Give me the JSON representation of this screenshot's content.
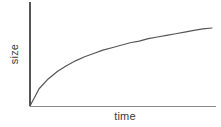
{
  "chart_data": {
    "type": "line",
    "title": "",
    "subtitle": "",
    "xlabel": "time",
    "ylabel": "size",
    "grid": false,
    "legend": null,
    "tick_labels": {
      "x": [],
      "y": []
    },
    "axis_style": {
      "spines": [
        "left",
        "bottom"
      ],
      "arrowheads": false,
      "ticks": false
    },
    "xlim": [
      0,
      1
    ],
    "ylim": [
      0,
      1
    ],
    "annotations": [],
    "series": [
      {
        "name": "growth",
        "color": "#555555",
        "width": 1.2,
        "x": [
          0.0,
          0.05,
          0.1,
          0.15,
          0.2,
          0.25,
          0.3,
          0.35,
          0.4,
          0.45,
          0.5,
          0.55,
          0.6,
          0.65,
          0.7,
          0.75,
          0.8,
          0.85,
          0.9,
          0.95,
          1.0
        ],
        "y": [
          0.0,
          0.21,
          0.33,
          0.42,
          0.49,
          0.55,
          0.6,
          0.64,
          0.68,
          0.71,
          0.74,
          0.77,
          0.79,
          0.82,
          0.84,
          0.86,
          0.88,
          0.9,
          0.92,
          0.94,
          0.95
        ]
      }
    ]
  },
  "colors": {
    "background": "#ffffff",
    "curve": "#555555",
    "y_axis": "#555555",
    "x_axis": "#8a8a8a",
    "label_text": "#3a3a3a"
  }
}
